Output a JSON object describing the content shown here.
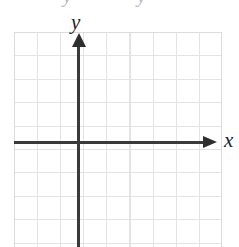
{
  "figure": {
    "kind": "cartesian-coordinate-grid",
    "width": 239,
    "height": 247,
    "background_color": "#ffffff"
  },
  "clipped_text": {
    "fragment_left": "y",
    "fragment_right": "y"
  },
  "axes": {
    "x": {
      "label": "x",
      "color": "#3a3a3a",
      "arrow": "right",
      "arrow_icon": "arrow-right-icon"
    },
    "y": {
      "label": "y",
      "color": "#3a3a3a",
      "arrow": "up",
      "arrow_icon": "arrow-up-icon"
    }
  },
  "grid": {
    "line_color": "#e3e3e3",
    "border_color": "#dcdcdc",
    "cell_size_px": 23,
    "columns": 9,
    "rows": 9
  },
  "chart_data": {
    "type": "scatter",
    "title": "",
    "subtitle": "",
    "xlabel": "x",
    "ylabel": "y",
    "series": [
      {
        "name": "",
        "x": [],
        "y": []
      }
    ],
    "x": [],
    "values": [],
    "categories": [],
    "xlim": [
      -3,
      6
    ],
    "ylim": [
      -4.5,
      4.5
    ],
    "xticks": [],
    "yticks": [],
    "xticklabels": [],
    "yticklabels": [],
    "grid": true,
    "legend": false,
    "legend_position": "none",
    "annotations": []
  }
}
